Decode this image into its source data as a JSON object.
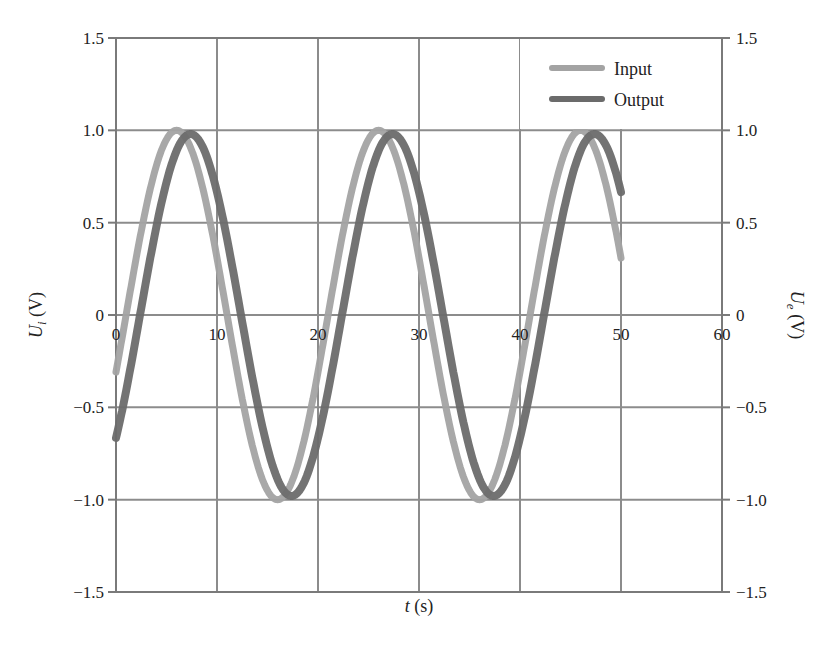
{
  "chart_data": {
    "type": "line",
    "title": "",
    "xlabel": "t (s)",
    "xlabel_parts": {
      "var": "t",
      "unit": " (s)"
    },
    "ylabel_left": "U_i (V)",
    "ylabel_left_parts": {
      "var": "U",
      "sub": "i",
      "unit": " (V)"
    },
    "ylabel_right": "U_e (V)",
    "ylabel_right_parts": {
      "var": "U",
      "sub": "e",
      "unit": " (V)"
    },
    "xlim": [
      0,
      60
    ],
    "ylim": [
      -1.5,
      1.5
    ],
    "x_ticks": [
      "0",
      "10",
      "20",
      "30",
      "40",
      "50",
      "60"
    ],
    "x_tick_values": [
      0,
      10,
      20,
      30,
      40,
      50,
      60
    ],
    "y_ticks": [
      "1.5",
      "1.0",
      "0.5",
      "0",
      "−0.5",
      "−1.0",
      "−1.5"
    ],
    "y_tick_values": [
      1.5,
      1.0,
      0.5,
      0,
      -0.5,
      -1.0,
      -1.5
    ],
    "grid": true,
    "legend_position": "upper right",
    "series": [
      {
        "name": "Input",
        "color": "#a3a3a3",
        "line_width": 7,
        "x": [
          0,
          2,
          4,
          6,
          8,
          10,
          12,
          14,
          16,
          18,
          20,
          22,
          24,
          26,
          28,
          30,
          32,
          34,
          36,
          38,
          40,
          42,
          44,
          46,
          48,
          50
        ],
        "values": [
          -0.31,
          0.31,
          0.81,
          1.0,
          0.81,
          0.31,
          -0.31,
          -0.81,
          -1.0,
          -0.81,
          -0.31,
          0.31,
          0.81,
          1.0,
          0.81,
          0.31,
          -0.31,
          -0.81,
          -1.0,
          -0.81,
          -0.31,
          0.31,
          0.81,
          1.0,
          0.81,
          0.31
        ]
      },
      {
        "name": "Output",
        "color": "#6b6b6b",
        "line_width": 8,
        "x": [
          0,
          2,
          4,
          6,
          8,
          10,
          12,
          14,
          16,
          18,
          20,
          22,
          24,
          26,
          28,
          30,
          32,
          34,
          36,
          38,
          40,
          42,
          44,
          46,
          48,
          50
        ],
        "values": [
          -0.54,
          0.08,
          0.64,
          0.97,
          0.92,
          0.52,
          -0.08,
          -0.64,
          -0.97,
          -0.92,
          -0.52,
          0.08,
          0.64,
          0.97,
          0.92,
          0.52,
          -0.08,
          -0.64,
          -0.97,
          -0.92,
          -0.52,
          0.08,
          0.64,
          0.97,
          0.92,
          0.42
        ]
      }
    ],
    "model": {
      "period_s": 20,
      "amplitude": 1.0,
      "input_phase_rad": -0.314,
      "output_lag_s": 0.55
    }
  },
  "legend": {
    "items": [
      {
        "label": "Input",
        "color": "#a3a3a3"
      },
      {
        "label": "Output",
        "color": "#6b6b6b"
      }
    ]
  },
  "caption": {
    "text_partial": "FIGURE (caption text cropped at bottom edge of image)"
  },
  "style": {
    "grid_color": "#8c8c8c",
    "axis_color": "#7a7a7a",
    "background": "#ffffff"
  }
}
